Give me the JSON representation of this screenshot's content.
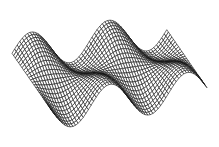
{
  "chart_data": {
    "type": "surface-wireframe",
    "title": "",
    "xlabel": "",
    "ylabel": "",
    "zlabel": "",
    "axes_visible": false,
    "grid": false,
    "legend": null,
    "surface": {
      "function": "z = sin(x) * cos(0.5*y)",
      "x_range": [
        0,
        12.566
      ],
      "y_range": [
        0,
        6.283
      ],
      "x_steps": 60,
      "y_steps": 24,
      "z_scale": 1.0
    },
    "view": {
      "azimuth_deg": -18,
      "elevation_deg": 28
    },
    "style": {
      "line_color": "#111111",
      "background": "#ffffff",
      "line_width": 0.6
    }
  }
}
